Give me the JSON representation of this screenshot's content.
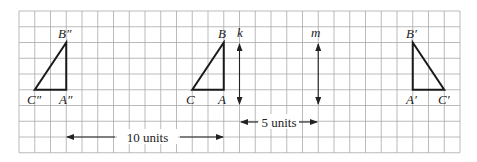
{
  "diagram": {
    "type": "transformation-grid",
    "grid": {
      "columns": 28,
      "rows": 9,
      "line_color": "#a9a9a9"
    },
    "triangles": [
      {
        "name": "ABC",
        "vertices": [
          {
            "label": "B",
            "col": 13,
            "row": 2
          },
          {
            "label": "A",
            "col": 13,
            "row": 5
          },
          {
            "label": "C",
            "col": 11,
            "row": 5
          }
        ]
      },
      {
        "name": "A'B'C'",
        "vertices": [
          {
            "label": "B'",
            "col": 25,
            "row": 2
          },
          {
            "label": "A'",
            "col": 25,
            "row": 5
          },
          {
            "label": "C'",
            "col": 27,
            "row": 5
          }
        ]
      },
      {
        "name": "A''B''C''",
        "vertices": [
          {
            "label": "B''",
            "col": 3,
            "row": 2
          },
          {
            "label": "A''",
            "col": 3,
            "row": 5
          },
          {
            "label": "C''",
            "col": 1,
            "row": 5
          }
        ]
      }
    ],
    "lines": [
      {
        "label": "k",
        "col": 14
      },
      {
        "label": "m",
        "col": 19
      }
    ],
    "measurements": [
      {
        "label": "10 units",
        "from_col": 3,
        "to_col": 13
      },
      {
        "label": "5 units",
        "from_col": 14,
        "to_col": 19
      }
    ]
  },
  "labels": {
    "B": "B",
    "A": "A",
    "C": "C",
    "B1": "B′",
    "A1": "A′",
    "C1": "C′",
    "B2": "B″",
    "A2": "A″",
    "C2": "C″",
    "k": "k",
    "m": "m",
    "ten_units": "10 units",
    "five_units": "5 units"
  }
}
